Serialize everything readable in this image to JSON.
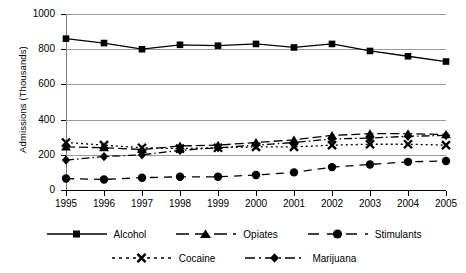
{
  "chart_data": {
    "type": "line",
    "title": "",
    "xlabel": "",
    "ylabel": "Admissions (Thousands)",
    "categories": [
      "1995",
      "1996",
      "1997",
      "1998",
      "1999",
      "2000",
      "2001",
      "2002",
      "2003",
      "2004",
      "2005"
    ],
    "x": [
      1995,
      1996,
      1997,
      1998,
      1999,
      2000,
      2001,
      2002,
      2003,
      2004,
      2005
    ],
    "ylim": [
      0,
      1000
    ],
    "xlim": [
      1995,
      2005
    ],
    "yticks": [
      0,
      200,
      400,
      600,
      800,
      1000
    ],
    "ytick_labels": [
      "0",
      "200",
      "400",
      "600",
      "800",
      "1000"
    ],
    "xtick_labels": [
      "1995",
      "1996",
      "1997",
      "1998",
      "1999",
      "2000",
      "2001",
      "2002",
      "2003",
      "2004",
      "2005"
    ],
    "grid": true,
    "legend_position": "bottom",
    "series": [
      {
        "name": "Alcohol",
        "marker": "square",
        "linestyle": "solid",
        "color": "#000000",
        "values": [
          860,
          835,
          800,
          825,
          820,
          830,
          810,
          830,
          790,
          760,
          730
        ]
      },
      {
        "name": "Opiates",
        "marker": "triangle",
        "linestyle": "dashed",
        "color": "#000000",
        "values": [
          245,
          240,
          230,
          250,
          255,
          270,
          285,
          310,
          320,
          320,
          315
        ]
      },
      {
        "name": "Stimulants",
        "marker": "circle",
        "linestyle": "long-dash",
        "color": "#000000",
        "values": [
          65,
          60,
          70,
          75,
          75,
          85,
          100,
          130,
          145,
          160,
          165
        ]
      },
      {
        "name": "Cocaine",
        "marker": "x",
        "linestyle": "dotted",
        "color": "#000000",
        "values": [
          270,
          255,
          240,
          235,
          240,
          245,
          245,
          255,
          260,
          260,
          255
        ]
      },
      {
        "name": "Marijuana",
        "marker": "diamond",
        "linestyle": "dash-dot",
        "color": "#000000",
        "values": [
          170,
          190,
          200,
          225,
          240,
          255,
          270,
          290,
          295,
          305,
          310
        ]
      }
    ]
  },
  "axes": {
    "y_title": "Admissions (Thousands)",
    "y_labels": [
      "1000",
      "800",
      "600",
      "400",
      "200",
      "0"
    ],
    "x_labels": [
      "1995",
      "1996",
      "1997",
      "1998",
      "1999",
      "2000",
      "2001",
      "2002",
      "2003",
      "2004",
      "2005"
    ]
  },
  "legend": {
    "row1": [
      {
        "label": "Alcohol",
        "marker": "square-marker",
        "line": "solid-line"
      },
      {
        "label": "Opiates",
        "marker": "triangle-marker",
        "line": "dashed-line"
      },
      {
        "label": "Stimulants",
        "marker": "circle-marker",
        "line": "long-dash-line"
      }
    ],
    "row2": [
      {
        "label": "Cocaine",
        "marker": "x-marker",
        "line": "dotted-line"
      },
      {
        "label": "Marijuana",
        "marker": "diamond-marker",
        "line": "dash-dot-line"
      }
    ]
  },
  "colors": {
    "ink": "#000000",
    "grid": "#9a9a9a",
    "background": "#ffffff"
  }
}
